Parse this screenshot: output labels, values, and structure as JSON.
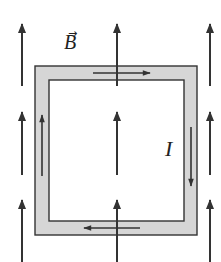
{
  "diagram": {
    "type": "current loop in uniform magnetic field",
    "labels": {
      "field": "B",
      "field_vector_mark": "→",
      "current": "I"
    },
    "colors": {
      "background": "#ffffff",
      "line": "#333333",
      "loop_fill": "#d6d6d6"
    },
    "field_arrows": {
      "direction": "up",
      "columns_x": [
        22,
        117,
        210
      ],
      "rows": [
        {
          "y_start": 86,
          "y_end": 24
        },
        {
          "y_start": 175,
          "y_end": 112
        },
        {
          "y_start": 262,
          "y_end": 200
        }
      ]
    },
    "loop": {
      "outer": {
        "x": 35,
        "y": 66,
        "width": 162,
        "height": 169
      },
      "inner": {
        "x": 49,
        "y": 80,
        "width": 135,
        "height": 141
      },
      "current_direction": "clockwise",
      "current_arrows": [
        {
          "side": "top",
          "direction": "right"
        },
        {
          "side": "right",
          "direction": "down"
        },
        {
          "side": "bottom",
          "direction": "left"
        },
        {
          "side": "left",
          "direction": "up"
        }
      ]
    }
  }
}
